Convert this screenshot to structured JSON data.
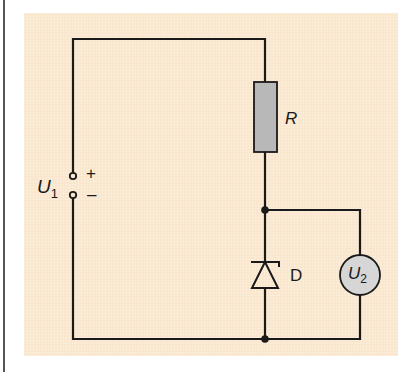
{
  "diagram": {
    "type": "circuit-schematic",
    "colors": {
      "background": "#ffffff",
      "panel": "#f9e6cc",
      "wire": "#1a1a1a",
      "resistor_fill": "#b8b8b8",
      "meter_fill": "#d6d6d6"
    },
    "components": {
      "source": {
        "symbol": "U",
        "subscript": "1",
        "plus": "+",
        "minus": "–"
      },
      "resistor": {
        "label": "R"
      },
      "diode": {
        "label": "D",
        "kind": "zener"
      },
      "voltmeter": {
        "symbol": "U",
        "subscript": "2"
      }
    }
  }
}
